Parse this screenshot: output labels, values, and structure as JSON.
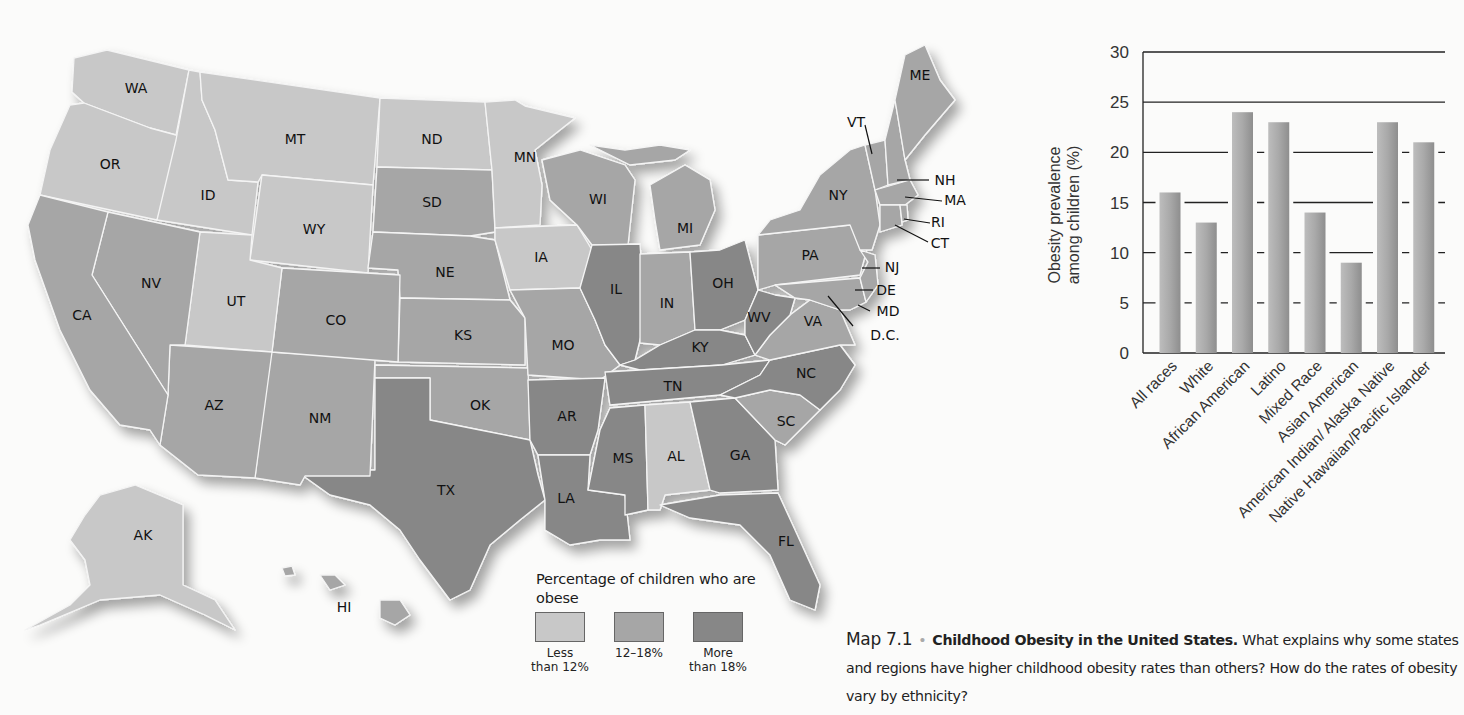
{
  "colors": {
    "low": "#c8c8c8",
    "mid": "#a6a6a6",
    "high": "#878787",
    "bar": "#a8a8a8",
    "background": "#fbfbfa"
  },
  "map": {
    "title": "Childhood Obesity in the United States",
    "state_labels": [
      {
        "abbr": "WA",
        "x": 136,
        "y": 93,
        "category": "low"
      },
      {
        "abbr": "OR",
        "x": 110,
        "y": 169,
        "category": "low"
      },
      {
        "abbr": "MT",
        "x": 295,
        "y": 144,
        "category": "low"
      },
      {
        "abbr": "ID",
        "x": 208,
        "y": 200,
        "category": "low"
      },
      {
        "abbr": "WY",
        "x": 314,
        "y": 234,
        "category": "low"
      },
      {
        "abbr": "ND",
        "x": 432,
        "y": 144,
        "category": "low"
      },
      {
        "abbr": "SD",
        "x": 432,
        "y": 207,
        "category": "mid"
      },
      {
        "abbr": "MN",
        "x": 525,
        "y": 162,
        "category": "low"
      },
      {
        "abbr": "WI",
        "x": 598,
        "y": 204,
        "category": "mid"
      },
      {
        "abbr": "MI",
        "x": 685,
        "y": 233,
        "category": "mid"
      },
      {
        "abbr": "NY",
        "x": 838,
        "y": 200,
        "category": "mid"
      },
      {
        "abbr": "VT",
        "x": 856,
        "y": 127,
        "category": "mid"
      },
      {
        "abbr": "ME",
        "x": 920,
        "y": 80,
        "category": "mid"
      },
      {
        "abbr": "NH",
        "x": 945,
        "y": 185,
        "category": "mid"
      },
      {
        "abbr": "MA",
        "x": 955,
        "y": 205,
        "category": "mid"
      },
      {
        "abbr": "RI",
        "x": 938,
        "y": 227,
        "category": "mid"
      },
      {
        "abbr": "CT",
        "x": 940,
        "y": 248,
        "category": "mid"
      },
      {
        "abbr": "NJ",
        "x": 892,
        "y": 272,
        "category": "mid"
      },
      {
        "abbr": "DE",
        "x": 886,
        "y": 295,
        "category": "mid"
      },
      {
        "abbr": "MD",
        "x": 888,
        "y": 316,
        "category": "mid"
      },
      {
        "abbr": "D.C.",
        "x": 885,
        "y": 340,
        "category": "mid"
      },
      {
        "abbr": "NE",
        "x": 445,
        "y": 277,
        "category": "mid"
      },
      {
        "abbr": "IA",
        "x": 541,
        "y": 262,
        "category": "low"
      },
      {
        "abbr": "IL",
        "x": 616,
        "y": 294,
        "category": "high"
      },
      {
        "abbr": "IN",
        "x": 667,
        "y": 308,
        "category": "mid"
      },
      {
        "abbr": "OH",
        "x": 723,
        "y": 288,
        "category": "high"
      },
      {
        "abbr": "PA",
        "x": 810,
        "y": 260,
        "category": "mid"
      },
      {
        "abbr": "WV",
        "x": 759,
        "y": 322,
        "category": "high"
      },
      {
        "abbr": "VA",
        "x": 813,
        "y": 326,
        "category": "mid"
      },
      {
        "abbr": "KY",
        "x": 700,
        "y": 352,
        "category": "high"
      },
      {
        "abbr": "NV",
        "x": 151,
        "y": 288,
        "category": "mid"
      },
      {
        "abbr": "UT",
        "x": 236,
        "y": 306,
        "category": "low"
      },
      {
        "abbr": "CO",
        "x": 336,
        "y": 325,
        "category": "mid"
      },
      {
        "abbr": "KS",
        "x": 463,
        "y": 340,
        "category": "mid"
      },
      {
        "abbr": "MO",
        "x": 563,
        "y": 350,
        "category": "mid"
      },
      {
        "abbr": "CA",
        "x": 82,
        "y": 320,
        "category": "mid"
      },
      {
        "abbr": "AZ",
        "x": 214,
        "y": 410,
        "category": "mid"
      },
      {
        "abbr": "NM",
        "x": 320,
        "y": 423,
        "category": "mid"
      },
      {
        "abbr": "OK",
        "x": 480,
        "y": 410,
        "category": "mid"
      },
      {
        "abbr": "TX",
        "x": 446,
        "y": 495,
        "category": "high"
      },
      {
        "abbr": "AR",
        "x": 567,
        "y": 421,
        "category": "high"
      },
      {
        "abbr": "TN",
        "x": 673,
        "y": 391,
        "category": "high"
      },
      {
        "abbr": "NC",
        "x": 806,
        "y": 378,
        "category": "high"
      },
      {
        "abbr": "SC",
        "x": 786,
        "y": 426,
        "category": "mid"
      },
      {
        "abbr": "MS",
        "x": 623,
        "y": 463,
        "category": "high"
      },
      {
        "abbr": "AL",
        "x": 676,
        "y": 461,
        "category": "low"
      },
      {
        "abbr": "GA",
        "x": 740,
        "y": 460,
        "category": "high"
      },
      {
        "abbr": "LA",
        "x": 566,
        "y": 503,
        "category": "high"
      },
      {
        "abbr": "FL",
        "x": 786,
        "y": 546,
        "category": "high"
      },
      {
        "abbr": "AK",
        "x": 143,
        "y": 540,
        "category": "low"
      },
      {
        "abbr": "HI",
        "x": 344,
        "y": 612,
        "category": "mid"
      }
    ]
  },
  "legend": {
    "title": "Percentage of children who are obese",
    "items": [
      {
        "label": "Less\nthan 12%",
        "color_key": "low",
        "color": "#c8c8c8"
      },
      {
        "label": "12–18%",
        "color_key": "mid",
        "color": "#a6a6a6"
      },
      {
        "label": "More\nthan 18%",
        "color_key": "high",
        "color": "#878787"
      }
    ]
  },
  "caption": {
    "figure_number": "Map 7.1",
    "bullet": "•",
    "title": "Childhood Obesity in the United States.",
    "text": "What explains why some states and regions have higher childhood obesity rates than others? How do the rates of obesity vary by ethnicity?"
  },
  "chart_data": {
    "type": "bar",
    "title": "",
    "xlabel": "",
    "ylabel": "Obesity prevalence among children (%)",
    "ylabel_lines": [
      "Obesity prevalence",
      "among children (%)"
    ],
    "categories": [
      "All races",
      "White",
      "African American",
      "Latino",
      "Mixed Race",
      "Asian American",
      "American Indian/ Alaska Native",
      "Native Hawaiian/Pacific Islander"
    ],
    "values": [
      16,
      13,
      24,
      23,
      14,
      9,
      23,
      21
    ],
    "ylim": [
      0,
      30
    ],
    "yticks": [
      0,
      5,
      10,
      15,
      20,
      25,
      30
    ],
    "grid": true,
    "legend": null
  }
}
